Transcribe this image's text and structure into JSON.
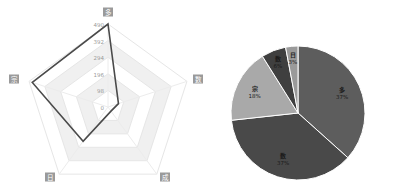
{
  "chart_data": [
    {
      "type": "radar",
      "title": "",
      "indicators": [
        {
          "name": "多",
          "max": 490
        },
        {
          "name": "数",
          "max": 490
        },
        {
          "name": "成",
          "max": 490
        },
        {
          "name": "日",
          "max": 490
        },
        {
          "name": "宗",
          "max": 490
        }
      ],
      "ticks": [
        "0",
        "98",
        "196",
        "294",
        "392",
        "490"
      ],
      "series": [
        {
          "name": "",
          "values": [
            490,
            65,
            30,
            250,
            470
          ]
        }
      ],
      "split_area": true,
      "legend": "none"
    },
    {
      "type": "pie",
      "title": "",
      "categories": [
        "多",
        "数",
        "宗",
        "数",
        "日"
      ],
      "labels": [
        {
          "name": "多",
          "percent": "37%"
        },
        {
          "name": "数",
          "percent": "37%"
        },
        {
          "name": "宗",
          "percent": "18%"
        },
        {
          "name": "数",
          "percent": "6%"
        },
        {
          "name": "日",
          "percent": "3%"
        }
      ],
      "values": [
        37,
        37,
        18,
        6,
        3
      ],
      "colors": [
        "#5d5d5d",
        "#494949",
        "#a9a9a9",
        "#3f3f3f",
        "#9a9a9a"
      ],
      "legend": "none"
    }
  ],
  "radar": {
    "axis_labels": [
      "多",
      "数",
      "成",
      "日",
      "宗"
    ],
    "tick_labels": [
      "0",
      "98",
      "196",
      "294",
      "392",
      "490"
    ]
  },
  "pie": {
    "slice_names": [
      "多",
      "数",
      "宗",
      "数",
      "日"
    ],
    "slice_percents": [
      "37%",
      "37%",
      "18%",
      "6%",
      "3%"
    ]
  }
}
